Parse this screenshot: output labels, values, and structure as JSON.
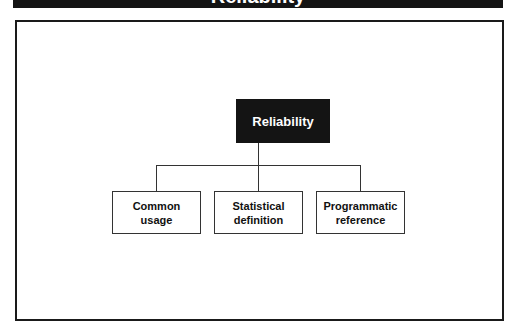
{
  "header": {
    "title": "Reliability"
  },
  "diagram": {
    "root": {
      "label": "Reliability"
    },
    "children": [
      {
        "label": "Common usage"
      },
      {
        "label": "Statistical definition"
      },
      {
        "label": "Programmatic reference"
      }
    ],
    "colors": {
      "root_fill": "#141414",
      "root_text": "#ffffff",
      "line": "#333333",
      "frame": "#1a1a1a"
    }
  }
}
